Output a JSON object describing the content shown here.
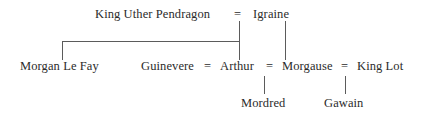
{
  "diagram": {
    "type": "family-tree",
    "background_color": "#ffffff",
    "text_color": "#2b2b2b",
    "line_color": "#5b5b5b",
    "width": 426,
    "height": 119
  },
  "marriage_symbol": "=",
  "generations": [
    {
      "row": 1,
      "people": [
        {
          "name": "King Uther Pendragon"
        },
        {
          "name": "Igraine"
        }
      ],
      "unions": [
        {
          "partners": [
            "King Uther Pendragon",
            "Igraine"
          ],
          "symbol": "="
        }
      ]
    },
    {
      "row": 2,
      "people": [
        {
          "name": "Morgan Le Fay"
        },
        {
          "name": "Guinevere"
        },
        {
          "name": "Arthur"
        },
        {
          "name": "Morgause"
        },
        {
          "name": "King Lot"
        }
      ],
      "unions": [
        {
          "partners": [
            "Guinevere",
            "Arthur"
          ],
          "symbol": "="
        },
        {
          "partners": [
            "Arthur",
            "Morgause"
          ],
          "symbol": "="
        },
        {
          "partners": [
            "Morgause",
            "King Lot"
          ],
          "symbol": "="
        }
      ]
    },
    {
      "row": 3,
      "people": [
        {
          "name": "Mordred"
        },
        {
          "name": "Gawain"
        }
      ],
      "unions": []
    }
  ],
  "nodes": {
    "uther": "King Uther Pendragon",
    "igraine": "Igraine",
    "morgan_le_fay": "Morgan Le Fay",
    "guinevere": "Guinevere",
    "arthur": "Arthur",
    "morgause": "Morgause",
    "king_lot": "King Lot",
    "mordred": "Mordred",
    "gawain": "Gawain"
  },
  "equals": {
    "uther_igraine": "=",
    "guinevere_arthur": "=",
    "arthur_morgause": "=",
    "morgause_kinglot": "="
  },
  "relationships": [
    {
      "parents": [
        "King Uther Pendragon",
        "Igraine"
      ],
      "children": [
        "Morgan Le Fay",
        "Arthur"
      ]
    },
    {
      "parents": [
        "Igraine"
      ],
      "children": [
        "Morgause"
      ]
    },
    {
      "parents": [
        "Arthur",
        "Morgause"
      ],
      "children": [
        "Mordred"
      ]
    },
    {
      "parents": [
        "Morgause",
        "King Lot"
      ],
      "children": [
        "Gawain"
      ]
    }
  ]
}
